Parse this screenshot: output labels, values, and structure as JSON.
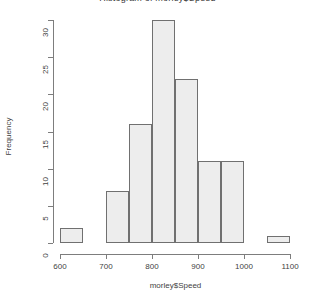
{
  "chart_data": {
    "type": "bar",
    "subtype": "histogram",
    "title": "Histogram of morley$Speed",
    "xlabel": "morley$Speed",
    "ylabel": "Frequency",
    "xlim": [
      600,
      1100
    ],
    "ylim": [
      0,
      30
    ],
    "binwidth": 50,
    "grid": false,
    "legend": null,
    "xticks": [
      600,
      700,
      800,
      900,
      1000,
      1100
    ],
    "xtick_labels": [
      "600",
      "700",
      "800",
      "900",
      "1000",
      "1100"
    ],
    "yticks": [
      0,
      5,
      10,
      15,
      20,
      25,
      30
    ],
    "ytick_labels": [
      "0",
      "5",
      "10",
      "15",
      "20",
      "25",
      "30"
    ],
    "bins": [
      {
        "start": 600,
        "end": 650,
        "count": 2
      },
      {
        "start": 650,
        "end": 700,
        "count": 0
      },
      {
        "start": 700,
        "end": 750,
        "count": 7
      },
      {
        "start": 750,
        "end": 800,
        "count": 16
      },
      {
        "start": 800,
        "end": 850,
        "count": 30
      },
      {
        "start": 850,
        "end": 900,
        "count": 22
      },
      {
        "start": 900,
        "end": 950,
        "count": 11
      },
      {
        "start": 950,
        "end": 1000,
        "count": 11
      },
      {
        "start": 1000,
        "end": 1050,
        "count": 0
      },
      {
        "start": 1050,
        "end": 1100,
        "count": 1
      }
    ],
    "categories": [
      "600-650",
      "650-700",
      "700-750",
      "750-800",
      "800-850",
      "850-900",
      "900-950",
      "950-1000",
      "1000-1050",
      "1050-1100"
    ],
    "values": [
      2,
      0,
      7,
      16,
      30,
      22,
      11,
      11,
      0,
      1
    ],
    "colors": {
      "bar_fill": "#ededed",
      "bar_border": "#707070",
      "axis": "#7d7d7d",
      "text": "#3f3f3f",
      "background": "#ffffff"
    }
  }
}
